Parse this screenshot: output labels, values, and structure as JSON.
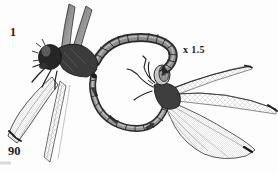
{
  "figure": {
    "number": "1",
    "magnification": "x 1.5",
    "page_number": "90"
  },
  "illustration": {
    "subject": "Pair of dragonflies in copulatory wheel position",
    "medium": "grayscale ink drawing"
  },
  "colors": {
    "background": "#fdfdfd",
    "ink": "#1c1c1c",
    "body_gray": "#8d8d8d",
    "wing_vein_gray": "#bdbdbd"
  }
}
